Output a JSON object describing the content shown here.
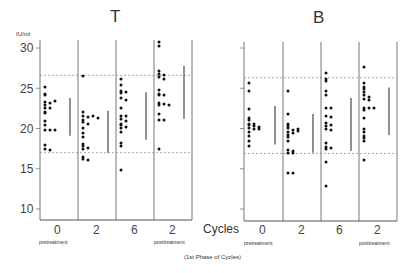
{
  "chart_data": [
    {
      "type": "scatter",
      "title": "T",
      "ylabel": "IU/ml",
      "xlabel": "Cycles",
      "ylim": [
        8,
        31.5
      ],
      "yticks": [
        10,
        15,
        20,
        25,
        30
      ],
      "categories": [
        "0",
        "2",
        "6",
        "2"
      ],
      "category_sublabels": [
        "pretreatment",
        "",
        "",
        "posttreatment"
      ],
      "reference_lines": {
        "upper": 26.6,
        "lower": 17.0,
        "style": "dashed"
      },
      "series": [
        {
          "name": "0 pretreatment",
          "values": [
            25.2,
            24.3,
            24.2,
            23.3,
            23.2,
            23.4,
            22.9,
            22.6,
            22.5,
            22.1,
            21.9,
            20.9,
            20.4,
            19.8,
            19.8,
            19.8,
            17.9,
            17.4,
            17.3
          ],
          "range_bar": [
            19.1,
            23.8
          ]
        },
        {
          "name": "2",
          "values": [
            26.5,
            22.0,
            21.5,
            21.4,
            21.5,
            21.3,
            21.0,
            20.8,
            20.6,
            20.1,
            19.5,
            18.9,
            18.1,
            17.8,
            17.6,
            17.5,
            16.4,
            16.2,
            16.1
          ],
          "range_bar": [
            17.0,
            22.2
          ]
        },
        {
          "name": "6",
          "values": [
            26.1,
            25.4,
            24.6,
            24.4,
            24.5,
            23.8,
            23.6,
            22.6,
            21.5,
            21.5,
            21.2,
            20.9,
            20.4,
            20.5,
            20.2,
            20.1,
            19.6,
            18.2,
            17.8,
            14.9
          ],
          "range_bar": [
            18.6,
            24.5
          ]
        },
        {
          "name": "2 posttreatment",
          "values": [
            30.8,
            30.2,
            26.8,
            26.6,
            27.1,
            26.4,
            26.2,
            24.8,
            24.3,
            24.1,
            24.1,
            23.2,
            22.9,
            23.1,
            22.9,
            21.8,
            21.1,
            21.1,
            17.4
          ],
          "range_bar": [
            21.2,
            27.8
          ]
        }
      ]
    },
    {
      "type": "scatter",
      "title": "B",
      "ylabel": "IU/ml",
      "xlabel": "Cycles",
      "ylim": [
        8,
        31.5
      ],
      "yticks": [
        10,
        15,
        20,
        25,
        30
      ],
      "categories": [
        "0",
        "2",
        "6",
        "2"
      ],
      "category_sublabels": [
        "pretreatment",
        "",
        "",
        "posttreatment"
      ],
      "reference_lines": {
        "upper": 26.3,
        "lower": 16.9,
        "style": "dashed"
      },
      "series": [
        {
          "name": "0 pretreatment",
          "values": [
            25.7,
            24.6,
            22.4,
            21.3,
            21.0,
            20.6,
            20.5,
            20.4,
            20.3,
            20.2,
            20.1,
            20.0,
            19.9,
            19.6,
            19.1,
            18.4,
            17.8
          ],
          "range_bar": [
            18.0,
            22.8
          ]
        },
        {
          "name": "2",
          "values": [
            24.6,
            21.8,
            20.6,
            20.3,
            20.1,
            19.8,
            19.6,
            19.4,
            19.9,
            19.7,
            19.2,
            18.9,
            18.5,
            17.3,
            17.2,
            16.9,
            16.9,
            14.5,
            14.5
          ],
          "range_bar": [
            17.0,
            21.8
          ]
        },
        {
          "name": "6",
          "values": [
            26.9,
            26.1,
            25.9,
            24.7,
            24.2,
            22.6,
            22.5,
            21.6,
            21.4,
            20.7,
            20.3,
            20.4,
            20.0,
            19.8,
            18.2,
            17.7,
            17.6,
            17.4,
            15.9,
            12.8
          ],
          "range_bar": [
            17.2,
            23.8
          ]
        },
        {
          "name": "2 posttreatment",
          "values": [
            27.6,
            25.7,
            25.1,
            24.9,
            24.5,
            24.2,
            23.9,
            23.7,
            23.5,
            22.5,
            22.3,
            22.5,
            22.5,
            21.3,
            20.0,
            19.6,
            19.1,
            18.8,
            18.5,
            16.1
          ],
          "range_bar": [
            19.2,
            25.1
          ]
        }
      ]
    }
  ],
  "labels": {
    "title_left": "T",
    "title_right": "B",
    "y_unit": "IU/ml",
    "y_ticks": [
      "30",
      "25",
      "20",
      "15",
      "10"
    ],
    "cycles_label": "Cycles",
    "x_ticks": [
      "0",
      "2",
      "6",
      "2"
    ],
    "pretreatment": "pretreatment",
    "posttreatment": "posttreatment",
    "footer": "(1st Phase of Cycles)"
  }
}
